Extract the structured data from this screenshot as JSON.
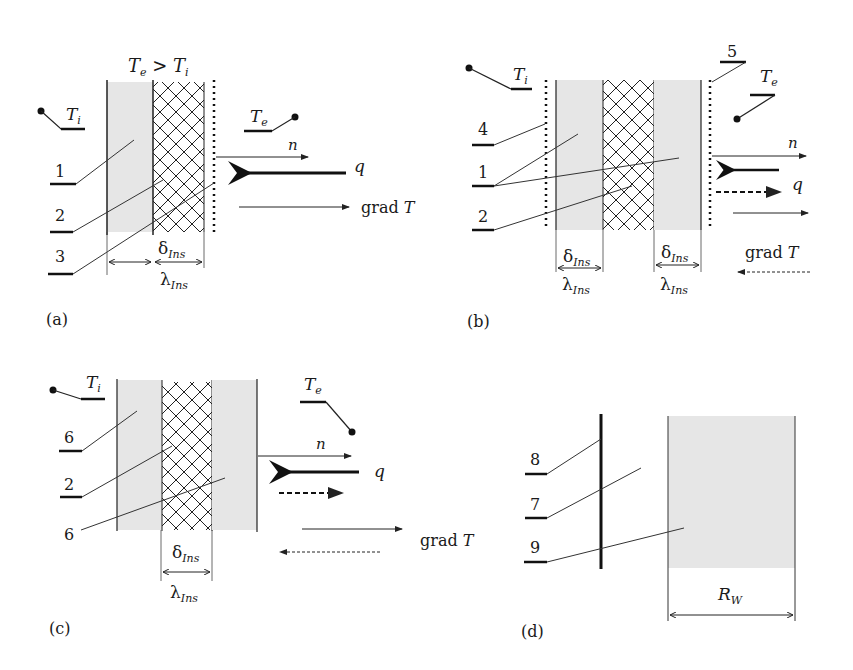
{
  "panels": {
    "a": {
      "caption": "(a)",
      "condition": "T_e > T_i",
      "inner_temp": "T_i",
      "outer_temp": "T_e",
      "callouts": [
        "1",
        "2",
        "3"
      ],
      "thickness": "δ_Ins",
      "conductivity": "λ_Ins",
      "vectors": [
        "n",
        "q",
        "grad T"
      ]
    },
    "b": {
      "caption": "(b)",
      "inner_temp": "T_i",
      "outer_temp": "T_e",
      "callouts": [
        "4",
        "1",
        "2",
        "5"
      ],
      "thickness_left": "δ_Ins",
      "thickness_right": "δ_Ins",
      "conductivity_left": "λ_Ins",
      "conductivity_right": "λ_Ins",
      "vectors": [
        "n",
        "q",
        "grad T"
      ]
    },
    "c": {
      "caption": "(c)",
      "inner_temp": "T_i",
      "outer_temp": "T_e",
      "callouts": [
        "6",
        "2",
        "6"
      ],
      "thickness": "δ_Ins",
      "conductivity": "λ_Ins",
      "vectors": [
        "n",
        "q",
        "grad T"
      ]
    },
    "d": {
      "caption": "(d)",
      "callouts": [
        "8",
        "7",
        "9"
      ],
      "resistance": "R_W"
    }
  }
}
